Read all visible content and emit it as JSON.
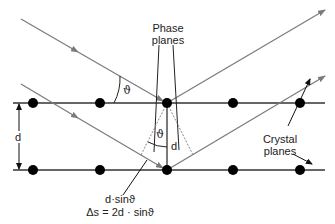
{
  "diagram": {
    "labels": {
      "phase_planes_line1": "Phase",
      "phase_planes_line2": "planes",
      "crystal_planes_line1": "Crystal",
      "crystal_planes_line2": "planes",
      "spacing_left": "d",
      "spacing_center": "d",
      "angle_incident": "ϑ",
      "angle_lower": "ϑ",
      "path_segment": "d·sinϑ",
      "path_difference": "Δs = 2d · sinϑ"
    },
    "colors": {
      "ray": "#7a7a7a",
      "plane": "#333333",
      "atom": "#000000",
      "text": "#222222"
    },
    "crystal_planes": [
      {
        "y": 103,
        "atoms_x": [
          33,
          100,
          167,
          233,
          300
        ]
      },
      {
        "y": 170,
        "atoms_x": [
          33,
          100,
          167,
          233,
          300
        ]
      }
    ]
  }
}
